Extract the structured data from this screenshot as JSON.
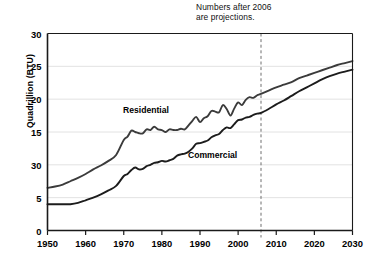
{
  "chart_data": {
    "type": "line",
    "title": "",
    "xlabel": "",
    "ylabel": "Quadrillion (BTU)",
    "xlim": [
      1950,
      2030
    ],
    "ylim": [
      0,
      30
    ],
    "grid": true,
    "legend_position": "inline-labels",
    "x_tick_labels": [
      "1950",
      "1960",
      "1970",
      "1980",
      "1990",
      "2000",
      "2010",
      "2020",
      "2030"
    ],
    "x_ticks": [
      1950,
      1960,
      1970,
      1980,
      1990,
      2000,
      2010,
      2020,
      2030
    ],
    "y_tick_labels": [
      "30",
      "25",
      "20",
      "15",
      "30",
      "5",
      "0"
    ],
    "y_ticks": [
      30,
      25,
      20,
      15,
      10,
      5,
      0
    ],
    "annotations": [
      {
        "name": "projection-note",
        "line1": "Numbers after 2006",
        "line2": "are projections."
      },
      {
        "name": "projection-divider",
        "x": 2006,
        "style": "dashed-vertical"
      }
    ],
    "series": [
      {
        "name": "Residential",
        "label": "Residential",
        "color": "#3b3b3b",
        "x": [
          1950,
          1952,
          1954,
          1956,
          1958,
          1960,
          1962,
          1964,
          1966,
          1968,
          1970,
          1971,
          1972,
          1973,
          1974,
          1975,
          1976,
          1977,
          1978,
          1979,
          1980,
          1981,
          1982,
          1983,
          1984,
          1985,
          1986,
          1987,
          1988,
          1989,
          1990,
          1991,
          1992,
          1993,
          1994,
          1995,
          1996,
          1997,
          1998,
          1999,
          2000,
          2001,
          2002,
          2003,
          2004,
          2005,
          2006,
          2008,
          2010,
          2012,
          2014,
          2016,
          2018,
          2020,
          2022,
          2024,
          2026,
          2028,
          2030
        ],
        "values": [
          6.5,
          6.7,
          7.0,
          7.5,
          8.0,
          8.6,
          9.3,
          9.9,
          10.6,
          11.5,
          13.8,
          14.3,
          15.2,
          15.0,
          14.8,
          14.8,
          15.4,
          15.3,
          15.8,
          15.4,
          15.3,
          15.0,
          15.4,
          15.3,
          15.3,
          15.5,
          15.4,
          16.0,
          16.7,
          17.3,
          16.5,
          17.1,
          17.4,
          18.2,
          18.1,
          18.0,
          19.1,
          18.5,
          17.5,
          18.6,
          19.5,
          19.1,
          19.9,
          20.3,
          20.2,
          20.6,
          20.8,
          21.3,
          21.8,
          22.2,
          22.6,
          23.2,
          23.6,
          24.0,
          24.4,
          24.8,
          25.2,
          25.5,
          25.8
        ]
      },
      {
        "name": "Commercial",
        "label": "Commercial",
        "color": "#1c1c1c",
        "x": [
          1950,
          1952,
          1954,
          1956,
          1958,
          1960,
          1962,
          1964,
          1966,
          1968,
          1970,
          1971,
          1972,
          1973,
          1974,
          1975,
          1976,
          1977,
          1978,
          1979,
          1980,
          1981,
          1982,
          1983,
          1984,
          1985,
          1986,
          1987,
          1988,
          1989,
          1990,
          1991,
          1992,
          1993,
          1994,
          1995,
          1996,
          1997,
          1998,
          1999,
          2000,
          2001,
          2002,
          2003,
          2004,
          2005,
          2006,
          2008,
          2010,
          2012,
          2014,
          2016,
          2018,
          2020,
          2022,
          2024,
          2026,
          2028,
          2030
        ],
        "values": [
          4.0,
          4.0,
          4.0,
          4.0,
          4.2,
          4.6,
          5.0,
          5.5,
          6.1,
          6.8,
          8.3,
          8.6,
          9.2,
          9.6,
          9.3,
          9.4,
          9.8,
          10.0,
          10.3,
          10.4,
          10.6,
          10.5,
          10.7,
          10.9,
          11.4,
          11.6,
          11.7,
          12.0,
          12.5,
          13.2,
          13.3,
          13.5,
          13.7,
          14.2,
          14.5,
          14.7,
          15.3,
          15.7,
          15.6,
          16.2,
          16.8,
          16.9,
          17.2,
          17.3,
          17.6,
          17.8,
          17.9,
          18.5,
          19.2,
          19.8,
          20.5,
          21.2,
          21.8,
          22.4,
          23.0,
          23.5,
          23.9,
          24.2,
          24.5
        ]
      }
    ]
  },
  "colors": {
    "axis": "#1a1a1a",
    "grid": "#e2e2e2",
    "background": "#ffffff",
    "divider": "#6e6e6e"
  }
}
